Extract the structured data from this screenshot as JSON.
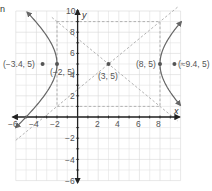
{
  "fragment_text": "n",
  "axes": {
    "x_label": "x",
    "y_label": "y",
    "x_ticks": [
      "−6",
      "−4",
      "−2",
      "2",
      "4",
      "6",
      "8"
    ],
    "y_ticks": [
      "10",
      "8",
      "6",
      "4",
      "2",
      "−2",
      "−4",
      "−6"
    ]
  },
  "points": [
    {
      "label": "(−3.4, 5)",
      "x": -3.4,
      "y": 5
    },
    {
      "label": "(−2, 5)",
      "x": -2,
      "y": 5
    },
    {
      "label": "(3, 5)",
      "x": 3,
      "y": 5
    },
    {
      "label": "(8, 5)",
      "x": 8,
      "y": 5
    },
    {
      "label": "(≈9.4, 5)",
      "x": 9.4,
      "y": 5
    }
  ],
  "hyperbola": {
    "center": [
      3,
      5
    ],
    "a": 5,
    "b": 4,
    "equation": "(x−3)²/25 − (y−5)²/16 = 1"
  },
  "colors": {
    "curve": "#666666",
    "axis": "#222222",
    "grid": "#e2e2e2",
    "dashed": "#aaaaaa",
    "point": "#555555"
  }
}
